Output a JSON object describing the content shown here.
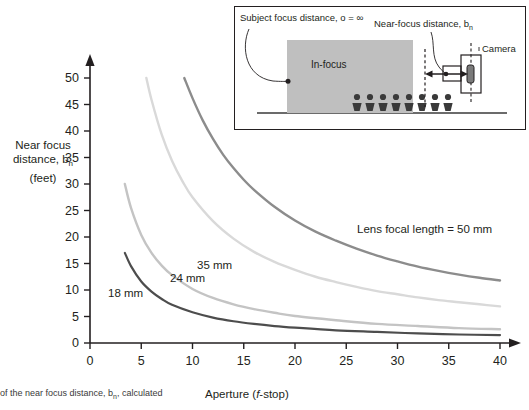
{
  "chart_data": {
    "type": "line",
    "title": "",
    "xlabel": "Aperture (f-stop)",
    "ylabel": "Near focus distance, bn (feet)",
    "xlim": [
      0,
      40
    ],
    "ylim": [
      0,
      50
    ],
    "xticks": [
      0,
      5,
      10,
      15,
      20,
      25,
      30,
      35,
      40
    ],
    "yticks": [
      0,
      5,
      10,
      15,
      20,
      25,
      30,
      35,
      40,
      45,
      50
    ],
    "grid": false,
    "legend_position": "inline-labels",
    "series": [
      {
        "name": "50 mm",
        "label": "Lens focal length = 50 mm",
        "color": "#8c8c8c",
        "x": [
          9.2,
          10,
          11,
          12,
          13,
          14,
          15,
          16,
          18,
          20,
          22,
          24,
          26,
          28,
          30,
          32,
          34,
          36,
          38,
          40
        ],
        "y": [
          50.0,
          46.2,
          42.0,
          38.5,
          35.5,
          33.0,
          30.8,
          28.9,
          25.7,
          23.1,
          21.0,
          19.3,
          17.8,
          16.5,
          15.4,
          14.4,
          13.6,
          12.9,
          12.3,
          11.8
        ]
      },
      {
        "name": "35 mm",
        "label": "35 mm",
        "color": "#d9d9d9",
        "x": [
          5.5,
          6,
          7,
          8,
          9,
          10,
          12,
          14,
          16,
          18,
          20,
          22,
          24,
          26,
          28,
          30,
          32,
          34,
          36,
          38,
          40
        ],
        "y": [
          50.0,
          45.9,
          39.3,
          34.4,
          30.6,
          27.5,
          23.0,
          19.7,
          17.2,
          15.3,
          13.8,
          12.5,
          11.5,
          10.6,
          9.8,
          9.2,
          8.6,
          8.1,
          7.7,
          7.3,
          6.9
        ]
      },
      {
        "name": "24 mm",
        "label": "24 mm",
        "color": "#c4c4c4",
        "x": [
          3.4,
          4,
          5,
          6,
          7,
          8,
          10,
          12,
          14,
          16,
          18,
          20,
          24,
          28,
          32,
          36,
          40
        ],
        "y": [
          30.0,
          25.5,
          20.4,
          17.0,
          14.6,
          12.8,
          10.2,
          8.5,
          7.3,
          6.4,
          5.7,
          5.1,
          4.3,
          3.6,
          3.2,
          2.8,
          2.6
        ]
      },
      {
        "name": "18 mm",
        "label": "18 mm",
        "color": "#4d4d4d",
        "x": [
          3.4,
          4,
          5,
          6,
          7,
          8,
          10,
          12,
          14,
          16,
          18,
          20,
          24,
          28,
          32,
          36,
          40
        ],
        "y": [
          17.0,
          14.5,
          11.6,
          9.7,
          8.3,
          7.2,
          5.8,
          4.8,
          4.1,
          3.6,
          3.2,
          2.9,
          2.4,
          2.1,
          1.8,
          1.6,
          1.5
        ]
      }
    ]
  },
  "axes": {
    "y_label_line1": "Near focus",
    "y_label_line2_pre": "distance, b",
    "y_label_line2_sub": "n",
    "y_label_line3": "(feet)",
    "x_label_pre": "Aperture (",
    "x_label_italic": "f",
    "x_label_post": "-stop)"
  },
  "curve_labels": {
    "l18": "18 mm",
    "l24": "24 mm",
    "l35": "35 mm",
    "l50": "Lens focal length = 50 mm"
  },
  "caption": {
    "text_pre": "of the near focus distance, b",
    "text_sub": "n",
    "text_post": ", calculated"
  },
  "inset": {
    "subject_label": "Subject focus distance, o = ∞",
    "near_label_pre": "Near-focus distance, b",
    "near_label_sub": "n",
    "camera_label": "Camera",
    "infocus_label": "In-focus",
    "box_fill": "#bfbfbf",
    "border_color": "#231f20"
  },
  "colors": {
    "axis": "#231f20",
    "text": "#231f20",
    "c18": "#4d4d4d",
    "c24": "#c4c4c4",
    "c35": "#d9d9d9",
    "c50": "#8c8c8c"
  }
}
